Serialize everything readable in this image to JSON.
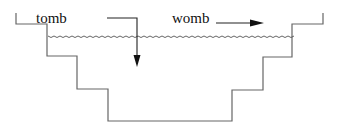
{
  "diagram": {
    "labels": {
      "tomb": "tomb",
      "womb": "womb"
    },
    "colors": {
      "outline": "#666666",
      "arrow": "#111111",
      "water": "#555555",
      "background": "#ffffff"
    },
    "elements": [
      "stepped-basin-outline",
      "water-surface-waves",
      "tomb-arrow-downward",
      "womb-arrow-rightward"
    ]
  }
}
